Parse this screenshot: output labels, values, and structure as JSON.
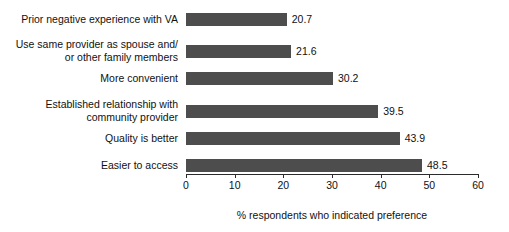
{
  "chart_data": {
    "type": "bar",
    "orientation": "horizontal",
    "title": "",
    "subtitle": "",
    "xlabel": "% respondents who indicated preference\nfor community provider",
    "ylabel": "",
    "xlim": [
      0,
      60
    ],
    "xticks": [
      0,
      10,
      20,
      30,
      40,
      50,
      60
    ],
    "xtick_labels": [
      "0",
      "10",
      "20",
      "30",
      "40",
      "50",
      "60"
    ],
    "grid": false,
    "legend": false,
    "bar_color": "#4d4d4d",
    "categories": [
      "Prior negative experience with VA",
      "Use same provider as spouse and/\nor other family members",
      "More convenient",
      "Established relationship with\ncommunity provider",
      "Quality is better",
      "Easier to access"
    ],
    "values": [
      20.7,
      21.6,
      30.2,
      39.5,
      43.9,
      48.5
    ],
    "value_labels": [
      "20.7",
      "21.6",
      "30.2",
      "39.5",
      "43.9",
      "48.5"
    ]
  },
  "axis": {
    "title_line1": "% respondents who indicated preference",
    "title_line2": "for community provider"
  }
}
